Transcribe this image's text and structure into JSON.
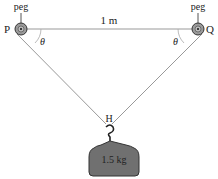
{
  "diagram": {
    "top_label": "1 m",
    "left_peg": {
      "label": "peg",
      "point": "P"
    },
    "right_peg": {
      "label": "peg",
      "point": "Q"
    },
    "left_angle": "θ",
    "right_angle": "θ",
    "hook_point": "H",
    "mass_label": "1.5 kg",
    "colors": {
      "line": "#888888",
      "pulley_fill": "#9a9a9a",
      "weight_fill": "#707070",
      "text": "#222222"
    }
  }
}
